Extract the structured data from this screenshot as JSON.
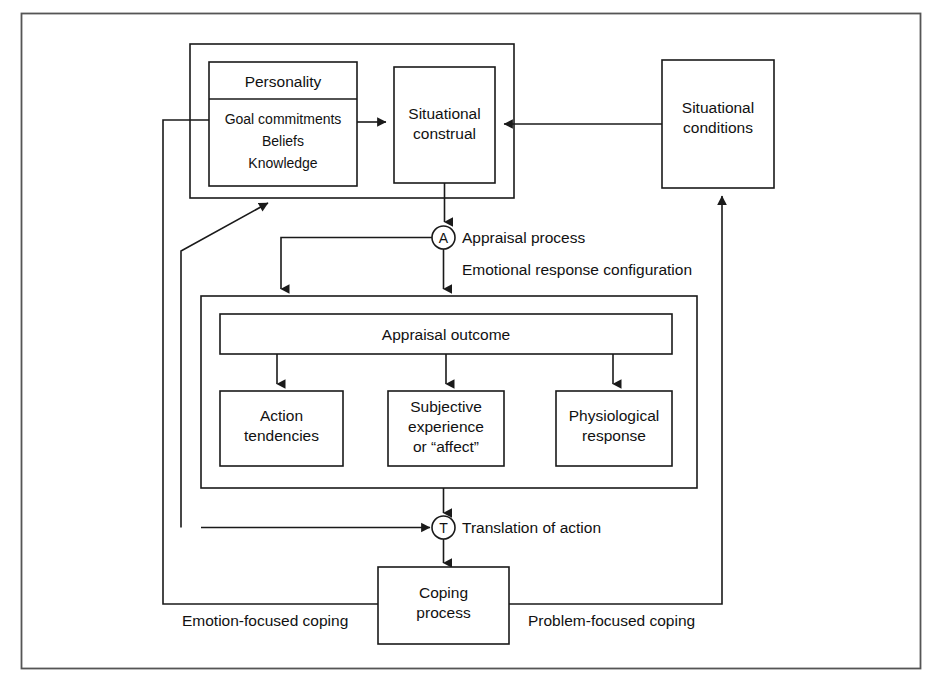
{
  "diagram": {
    "frame": {
      "stroke": "#555555"
    },
    "boxes": {
      "personality_header": "Personality",
      "personality_items": [
        "Goal commitments",
        "Beliefs",
        "Knowledge"
      ],
      "situational_construal": [
        "Situational",
        "construal"
      ],
      "situational_conditions": [
        "Situational",
        "conditions"
      ],
      "appraisal_outcome": "Appraisal outcome",
      "action_tendencies": [
        "Action",
        "tendencies"
      ],
      "subjective_experience": [
        "Subjective",
        "experience",
        "or “affect”"
      ],
      "physiological_response": [
        "Physiological",
        "response"
      ],
      "coping_process": [
        "Coping",
        "process"
      ]
    },
    "nodes": {
      "appraisal_symbol": "A",
      "appraisal_label": "Appraisal process",
      "translation_symbol": "T",
      "translation_label": "Translation of action"
    },
    "labels": {
      "emotional_response_configuration": "Emotional response configuration",
      "emotion_focused_coping": "Emotion-focused coping",
      "problem_focused_coping": "Problem-focused coping"
    },
    "colors": {
      "line": "#1a1a1a",
      "text": "#111111",
      "background": "#ffffff",
      "frame": "#555555"
    }
  }
}
